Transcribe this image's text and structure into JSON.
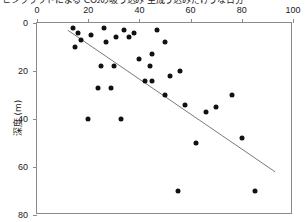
{
  "title": "ヒシクラウドによる CO₂の吸う込み 生成う込みだけうな日分",
  "axes": {
    "x": {
      "position": "top",
      "label": "",
      "ticks": [
        0,
        20,
        40,
        60,
        80,
        100
      ],
      "min": 0,
      "max": 100
    },
    "y": {
      "position": "left",
      "label": "深度 (m)",
      "ticks": [
        0,
        20,
        40,
        60,
        80
      ],
      "min": 0,
      "max": 80,
      "inverted": true
    }
  },
  "style": {
    "point_color": "#111111",
    "line_color": "#7a7a7a",
    "frame_color": "#8a8a8a",
    "text_color": "#1a1a1a"
  },
  "chart_data": {
    "type": "scatter",
    "title": "ヒシクラウドによる CO₂の吸う込み 生成う込みだけうな日分",
    "xlabel": "",
    "ylabel": "深度 (m)",
    "xlim": [
      0,
      100
    ],
    "ylim": [
      80,
      0
    ],
    "grid": false,
    "legend": null,
    "series": [
      {
        "name": "観測点",
        "marker": "filled-circle",
        "color": "#111111",
        "points": [
          {
            "x": 14,
            "y": 2
          },
          {
            "x": 16,
            "y": 4
          },
          {
            "x": 15,
            "y": 10
          },
          {
            "x": 17,
            "y": 7
          },
          {
            "x": 21,
            "y": 5
          },
          {
            "x": 26,
            "y": 2
          },
          {
            "x": 27,
            "y": 8
          },
          {
            "x": 31,
            "y": 6
          },
          {
            "x": 34,
            "y": 3
          },
          {
            "x": 36,
            "y": 6
          },
          {
            "x": 38,
            "y": 4
          },
          {
            "x": 25,
            "y": 18
          },
          {
            "x": 30,
            "y": 18
          },
          {
            "x": 40,
            "y": 15
          },
          {
            "x": 45,
            "y": 13
          },
          {
            "x": 44,
            "y": 18
          },
          {
            "x": 47,
            "y": 3
          },
          {
            "x": 50,
            "y": 8
          },
          {
            "x": 24,
            "y": 27
          },
          {
            "x": 29,
            "y": 27
          },
          {
            "x": 42,
            "y": 24
          },
          {
            "x": 45,
            "y": 24
          },
          {
            "x": 52,
            "y": 22
          },
          {
            "x": 56,
            "y": 20
          },
          {
            "x": 20,
            "y": 40
          },
          {
            "x": 33,
            "y": 40
          },
          {
            "x": 50,
            "y": 30
          },
          {
            "x": 58,
            "y": 34
          },
          {
            "x": 66,
            "y": 37
          },
          {
            "x": 70,
            "y": 35
          },
          {
            "x": 76,
            "y": 30
          },
          {
            "x": 62,
            "y": 50
          },
          {
            "x": 80,
            "y": 48
          },
          {
            "x": 55,
            "y": 70
          },
          {
            "x": 85,
            "y": 70
          }
        ]
      }
    ],
    "annotations": [
      {
        "type": "regression-line",
        "x0": 12,
        "y0": 3,
        "x1": 93,
        "y1": 62,
        "color": "#7a7a7a"
      }
    ]
  }
}
